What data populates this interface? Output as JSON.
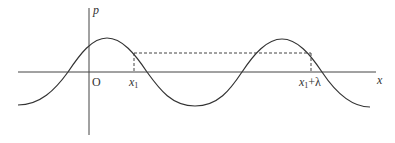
{
  "diagram": {
    "title": "",
    "axes": {
      "vertical_label": "p",
      "horizontal_label": "x",
      "origin_label": "O"
    },
    "markers": {
      "x1_label": "x",
      "x1_sub": "1",
      "x1_plus_lambda_sub": "1",
      "x1_plus_lambda_suffix": "+λ"
    },
    "colors": {
      "curve": "#333333",
      "axis": "#444444",
      "dashed": "#444444"
    },
    "curve": {
      "type": "sinusoid",
      "description": "Pressure wave p vs position x; dashed lines mark equal-phase points x1 and x1+λ separated by one wavelength"
    }
  }
}
